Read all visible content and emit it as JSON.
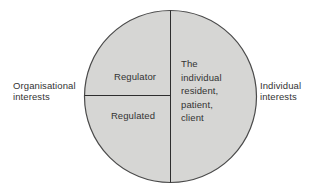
{
  "diagram": {
    "left_label": {
      "lines": [
        "Organisational",
        "interests"
      ]
    },
    "right_label": {
      "lines": [
        "Individual",
        "interests"
      ]
    },
    "circle": {
      "top_left_label": "Regulator",
      "bottom_left_label": "Regulated",
      "right_half_lines": [
        "The",
        "individual",
        "resident,",
        "patient,",
        "client"
      ]
    },
    "colors": {
      "background": "#ffffff",
      "circle_fill": "#d6d6d4",
      "circle_stroke": "#4a4a4a",
      "divider_line": "#2e2e2e",
      "text": "#333333"
    }
  }
}
